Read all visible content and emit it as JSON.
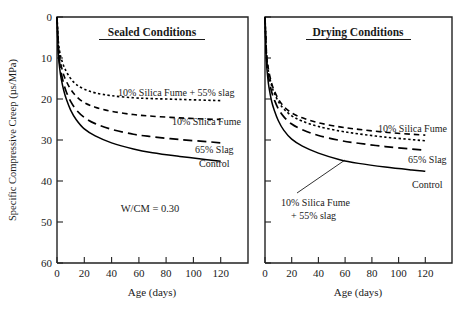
{
  "figure": {
    "background": "#ffffff",
    "ink": "#000000"
  },
  "axis": {
    "ylabel": "Specific Compressive Creep (µs/MPa)",
    "xlabel_left": "Age (days)",
    "xlabel_right": "Age (days)",
    "yticks": [
      "0",
      "10",
      "20",
      "30",
      "40",
      "50",
      "60"
    ],
    "xticks": [
      "0",
      "20",
      "40",
      "60",
      "80",
      "100",
      "120"
    ]
  },
  "left_panel": {
    "title": "Sealed Conditions",
    "note": "W/CM = 0.30",
    "labels": {
      "sf_slag": "10% Silica Fume + 55% slag",
      "sf": "10% Silica Fume",
      "slag": "65% Slag",
      "control": "Control"
    }
  },
  "right_panel": {
    "title": "Drying Conditions",
    "labels": {
      "sf": "10% Silica Fume",
      "slag": "65% Slag",
      "control": "Control",
      "sf_slag_line1": "10% Silica Fume",
      "sf_slag_line2": "+ 55% slag"
    }
  },
  "chart_data": {
    "type": "line",
    "xlabel": "Age (days)",
    "ylabel": "Specific Compressive Creep (µs/MPa)",
    "xlim": [
      0,
      140
    ],
    "ylim": [
      0,
      60
    ],
    "y_axis_inverted": true,
    "grid": false,
    "legend": "inline-curve-labels",
    "annotations": [
      "W/CM = 0.30"
    ],
    "panels": [
      {
        "name": "Sealed Conditions",
        "x": [
          0,
          1,
          2,
          3,
          5,
          7,
          10,
          14,
          20,
          28,
          40,
          56,
          70,
          90,
          110,
          120
        ],
        "series": [
          {
            "name": "10% Silica Fume + 55% slag",
            "style": "dotted",
            "values": [
              0,
              6.0,
              8.5,
              10.0,
              12.0,
              13.4,
              15.0,
              16.4,
              17.6,
              18.5,
              19.2,
              19.7,
              19.9,
              20.1,
              20.3,
              20.4
            ]
          },
          {
            "name": "10% Silica Fume",
            "style": "dashed",
            "values": [
              0,
              7.0,
              10.0,
              11.8,
              14.2,
              15.8,
              17.6,
              19.3,
              20.9,
              22.0,
              23.0,
              23.8,
              24.2,
              24.6,
              24.9,
              25.0
            ]
          },
          {
            "name": "65% Slag",
            "style": "long-dashed",
            "values": [
              0,
              8.0,
              11.4,
              13.5,
              16.4,
              18.4,
              20.6,
              22.6,
              24.5,
              26.0,
              27.4,
              28.6,
              29.2,
              29.9,
              30.4,
              30.7
            ]
          },
          {
            "name": "Control",
            "style": "solid",
            "values": [
              0,
              9.0,
              12.6,
              14.9,
              18.0,
              20.2,
              22.7,
              25.0,
              27.3,
              29.0,
              30.7,
              32.2,
              33.1,
              34.0,
              34.8,
              35.2
            ]
          }
        ]
      },
      {
        "name": "Drying Conditions",
        "x": [
          0,
          1,
          2,
          3,
          5,
          7,
          10,
          14,
          20,
          28,
          40,
          56,
          70,
          90,
          110,
          120
        ],
        "series": [
          {
            "name": "10% Silica Fume",
            "style": "dashed",
            "values": [
              0,
              8.0,
              11.4,
              13.5,
              16.2,
              18.0,
              20.0,
              21.8,
              23.4,
              24.6,
              25.8,
              26.8,
              27.4,
              28.1,
              28.6,
              28.8
            ]
          },
          {
            "name": "10% Silica Fume + 55% slag",
            "style": "dotted",
            "values": [
              0,
              8.4,
              11.9,
              14.0,
              16.8,
              18.6,
              20.6,
              22.4,
              24.1,
              25.4,
              26.7,
              27.8,
              28.5,
              29.3,
              29.9,
              30.2
            ]
          },
          {
            "name": "65% Slag",
            "style": "long-dashed",
            "values": [
              0,
              9.2,
              13.0,
              15.3,
              18.3,
              20.2,
              22.4,
              24.3,
              26.1,
              27.5,
              28.9,
              30.1,
              30.8,
              31.6,
              32.2,
              32.5
            ]
          },
          {
            "name": "Control",
            "style": "solid",
            "values": [
              0,
              10.4,
              14.6,
              17.2,
              20.6,
              22.8,
              25.3,
              27.6,
              29.8,
              31.5,
              33.2,
              34.8,
              35.7,
              36.6,
              37.3,
              37.6
            ]
          }
        ]
      }
    ]
  }
}
